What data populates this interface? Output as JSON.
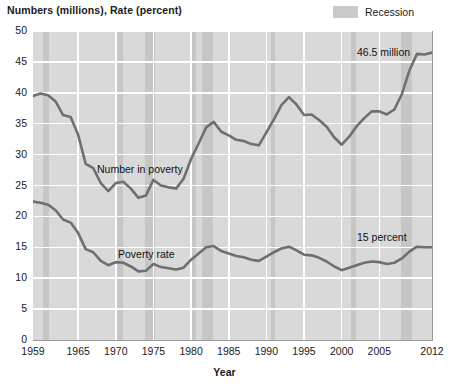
{
  "chart_title": "Numbers (millions), Rate (percent)",
  "legend": {
    "label": "Recession",
    "swatch_color": "#c6c6c6"
  },
  "axes": {
    "xlabel": "Year",
    "ylabel": "Numbers (millions), Rate (percent)",
    "yticks": [
      "0",
      "5",
      "10",
      "15",
      "20",
      "25",
      "30",
      "35",
      "40",
      "45",
      "50"
    ],
    "xticks": [
      "1959",
      "1965",
      "1970",
      "1975",
      "1980",
      "1985",
      "1990",
      "1995",
      "2000",
      "2005",
      "2012"
    ]
  },
  "annotations": {
    "number_series_label": "Number in poverty",
    "rate_series_label": "Poverty rate",
    "number_end_label": "46.5 million",
    "rate_end_label": "15 percent"
  },
  "colors": {
    "plot_background": "#d9d9d9",
    "recession_band": "#c6c6c6",
    "gridline": "#ffffff",
    "line": "#6f6f6f",
    "text": "#1a1a1a"
  },
  "chart_data": {
    "type": "line",
    "title": "Numbers (millions), Rate (percent)",
    "xlabel": "Year",
    "ylabel": "Numbers (millions), Rate (percent)",
    "xlim": [
      1959,
      2012
    ],
    "ylim": [
      0,
      50
    ],
    "grid": true,
    "legend_position": "top-right",
    "x": [
      1959,
      1960,
      1961,
      1962,
      1963,
      1964,
      1965,
      1966,
      1967,
      1968,
      1969,
      1970,
      1971,
      1972,
      1973,
      1974,
      1975,
      1976,
      1977,
      1978,
      1979,
      1980,
      1981,
      1982,
      1983,
      1984,
      1985,
      1986,
      1987,
      1988,
      1989,
      1990,
      1991,
      1992,
      1993,
      1994,
      1995,
      1996,
      1997,
      1998,
      1999,
      2000,
      2001,
      2002,
      2003,
      2004,
      2005,
      2006,
      2007,
      2008,
      2009,
      2010,
      2011,
      2012
    ],
    "series": [
      {
        "name": "Number in poverty",
        "units": "millions",
        "end_label": "46.5 million",
        "values": [
          39.5,
          39.9,
          39.6,
          38.6,
          36.4,
          36.1,
          33.2,
          28.5,
          27.8,
          25.4,
          24.1,
          25.4,
          25.6,
          24.5,
          23.0,
          23.4,
          25.9,
          25.0,
          24.7,
          24.5,
          26.1,
          29.3,
          31.8,
          34.4,
          35.3,
          33.7,
          33.1,
          32.4,
          32.2,
          31.7,
          31.5,
          33.6,
          35.7,
          38.0,
          39.3,
          38.1,
          36.4,
          36.5,
          35.6,
          34.5,
          32.8,
          31.6,
          32.9,
          34.6,
          35.9,
          37.0,
          37.0,
          36.5,
          37.3,
          39.8,
          43.6,
          46.3,
          46.2,
          46.5
        ]
      },
      {
        "name": "Poverty rate",
        "units": "percent",
        "end_label": "15 percent",
        "values": [
          22.4,
          22.2,
          21.9,
          21.0,
          19.5,
          19.0,
          17.3,
          14.7,
          14.2,
          12.8,
          12.1,
          12.6,
          12.5,
          11.9,
          11.1,
          11.2,
          12.3,
          11.8,
          11.6,
          11.4,
          11.7,
          13.0,
          14.0,
          15.0,
          15.2,
          14.4,
          14.0,
          13.6,
          13.4,
          13.0,
          12.8,
          13.5,
          14.2,
          14.8,
          15.1,
          14.5,
          13.8,
          13.7,
          13.3,
          12.7,
          11.9,
          11.3,
          11.7,
          12.1,
          12.5,
          12.7,
          12.6,
          12.3,
          12.5,
          13.2,
          14.3,
          15.1,
          15.0,
          15.0
        ]
      }
    ],
    "recessions": [
      {
        "start": 1960.3,
        "end": 1961.1
      },
      {
        "start": 1969.9,
        "end": 1970.9
      },
      {
        "start": 1973.9,
        "end": 1975.2
      },
      {
        "start": 1980.0,
        "end": 1980.6
      },
      {
        "start": 1981.5,
        "end": 1982.9
      },
      {
        "start": 1990.6,
        "end": 1991.2
      },
      {
        "start": 2001.2,
        "end": 2001.9
      },
      {
        "start": 2007.9,
        "end": 2009.4
      }
    ]
  }
}
